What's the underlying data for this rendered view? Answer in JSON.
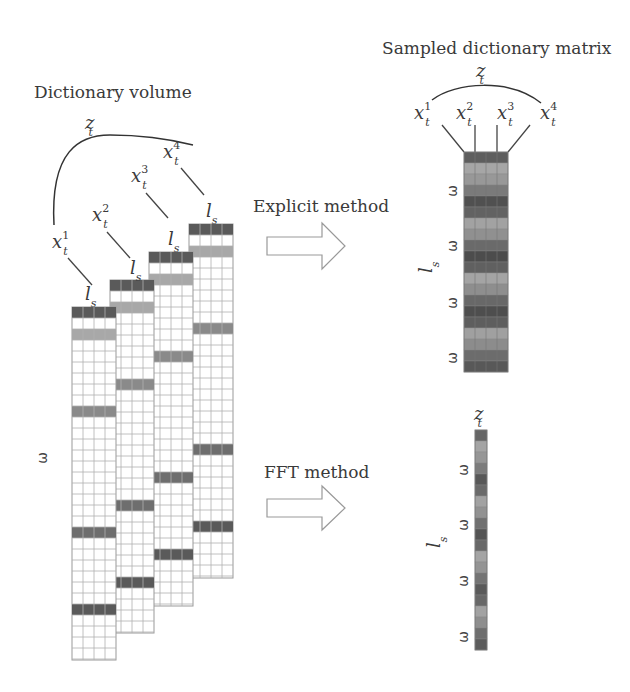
{
  "titles": {
    "left": "Dictionary volume",
    "right": "Sampled dictionary matrix"
  },
  "methods": {
    "explicit": "Explicit method",
    "fft": "FFT method"
  },
  "symbols": {
    "z": "z",
    "t": "t",
    "x": "x",
    "l": "l",
    "s": "s",
    "omega": "ω",
    "sup1": "1",
    "sup2": "2",
    "sup3": "3",
    "sup4": "4"
  },
  "colors": {
    "dark": "#5a5a5a",
    "mid_dark": "#6e6e6e",
    "mid": "#8a8a8a",
    "light": "#a8a8a8",
    "grid": "#b0b0b0"
  },
  "volume_columns": [
    {
      "x": 72,
      "top": 307,
      "bottom": 660,
      "highlights": [
        {
          "row": 0,
          "shade": "dark"
        },
        {
          "row": 2,
          "shade": "light"
        },
        {
          "row": 9,
          "shade": "mid"
        },
        {
          "row": 20,
          "shade": "mid_dark"
        },
        {
          "row": 27,
          "shade": "dark"
        }
      ]
    },
    {
      "x": 110,
      "top": 280,
      "bottom": 633,
      "highlights": [
        {
          "row": 0,
          "shade": "dark"
        },
        {
          "row": 2,
          "shade": "light"
        },
        {
          "row": 9,
          "shade": "mid"
        },
        {
          "row": 20,
          "shade": "mid_dark"
        },
        {
          "row": 27,
          "shade": "dark"
        }
      ]
    },
    {
      "x": 149,
      "top": 252,
      "bottom": 606,
      "highlights": [
        {
          "row": 0,
          "shade": "dark"
        },
        {
          "row": 2,
          "shade": "light"
        },
        {
          "row": 9,
          "shade": "mid"
        },
        {
          "row": 20,
          "shade": "mid_dark"
        },
        {
          "row": 27,
          "shade": "dark"
        }
      ]
    },
    {
      "x": 189,
      "top": 224,
      "bottom": 578,
      "highlights": [
        {
          "row": 0,
          "shade": "dark"
        },
        {
          "row": 2,
          "shade": "light"
        },
        {
          "row": 9,
          "shade": "mid"
        },
        {
          "row": 20,
          "shade": "mid_dark"
        },
        {
          "row": 27,
          "shade": "dark"
        }
      ]
    }
  ],
  "sampled_matrix": {
    "x": 464,
    "y": 152,
    "width": 44,
    "rows": 20,
    "row_height": 11,
    "row_shades": [
      "#5e5e5e",
      "#a6a6a6",
      "#989898",
      "#7a7a7a",
      "#505050",
      "#626262",
      "#a2a2a2",
      "#909090",
      "#6a6a6a",
      "#4c4c4c",
      "#606060",
      "#a4a4a4",
      "#8e8e8e",
      "#686868",
      "#4e4e4e",
      "#5e5e5e",
      "#a0a0a0",
      "#8c8c8c",
      "#6c6c6c",
      "#585858"
    ]
  },
  "fft_vector": {
    "x": 475,
    "y": 430,
    "width": 12,
    "rows": 20,
    "row_height": 11,
    "row_shades": [
      "#666666",
      "#a4a4a4",
      "#969696",
      "#7c7c7c",
      "#585858",
      "#6a6a6a",
      "#a2a2a2",
      "#929292",
      "#707070",
      "#545454",
      "#686868",
      "#a4a4a4",
      "#949494",
      "#747474",
      "#5a5a5a",
      "#686868",
      "#a2a2a2",
      "#8e8e8e",
      "#6e6e6e",
      "#5c5c5c"
    ]
  }
}
